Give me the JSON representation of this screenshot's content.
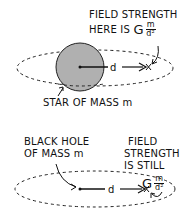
{
  "panel_top": {
    "annotation_line1": "FIELD STRENGTH",
    "annotation_line2": "HERE IS",
    "formula": {
      "constant": "G",
      "numerator": "m",
      "denominator": "d²"
    },
    "distance_label": "d",
    "object_label": "STAR OF MASS m",
    "star_color": "#b0b0b0"
  },
  "panel_bottom": {
    "object_label_line1": "BLACK HOLE",
    "object_label_line2": "OF MASS m",
    "annotation_line1": "FIELD",
    "annotation_line2": "STRENGTH",
    "annotation_line3": "IS STILL",
    "formula": {
      "constant": "G",
      "numerator": "m",
      "denominator": "d²"
    },
    "distance_label": "d"
  }
}
